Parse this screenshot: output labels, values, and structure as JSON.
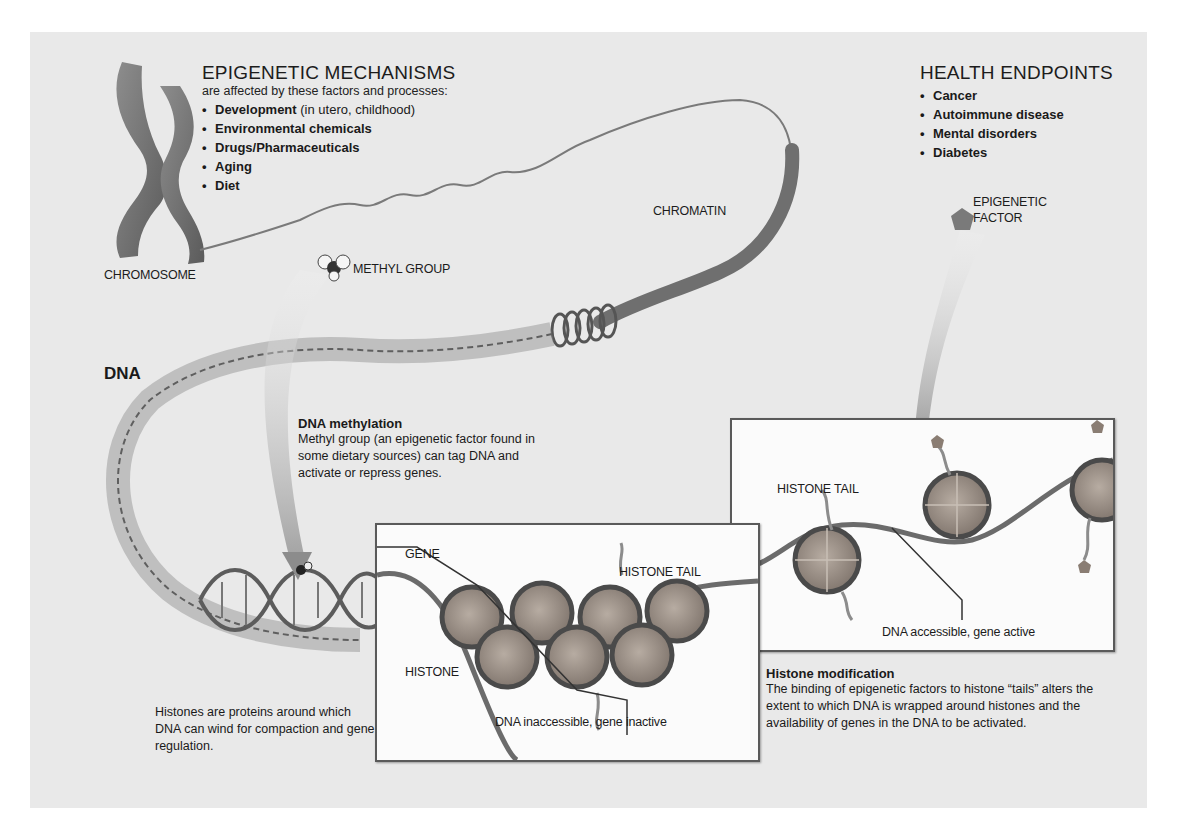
{
  "mechanisms": {
    "title": "EPIGENETIC MECHANISMS",
    "subtitle": "are affected by these factors and processes:",
    "items": [
      {
        "bold": "Development",
        "rest": " (in utero, childhood)"
      },
      {
        "bold": "Environmental chemicals",
        "rest": ""
      },
      {
        "bold": "Drugs/Pharmaceuticals",
        "rest": ""
      },
      {
        "bold": "Aging",
        "rest": ""
      },
      {
        "bold": "Diet",
        "rest": ""
      }
    ]
  },
  "health": {
    "title": "HEALTH ENDPOINTS",
    "items": [
      "Cancer",
      "Autoimmune disease",
      "Mental disorders",
      "Diabetes"
    ]
  },
  "labels": {
    "chromosome": "CHROMOSOME",
    "chromatin": "CHROMATIN",
    "methyl_group": "METHYL GROUP",
    "epigenetic_factor_line1": "EPIGENETIC",
    "epigenetic_factor_line2": "FACTOR",
    "dna": "DNA",
    "gene": "GENE",
    "histone_tail_left": "HISTONE TAIL",
    "histone": "HISTONE",
    "histone_tail_right": "HISTONE TAIL",
    "dna_inaccessible": "DNA inaccessible, gene inactive",
    "dna_accessible": "DNA accessible, gene active"
  },
  "methylation": {
    "heading": "DNA methylation",
    "body": "Methyl group (an epigenetic factor found in some dietary sources) can tag DNA and activate or repress genes."
  },
  "histones_note": {
    "body": "Histones are proteins around which DNA can wind for compaction and gene regulation."
  },
  "histone_modification": {
    "heading": "Histone modification",
    "body": "The binding of epigenetic factors to histone “tails” alters the extent to which DNA is wrapped around histones and the availability of genes in the DNA to be activated."
  },
  "colors": {
    "background": "#e9e9e9",
    "strand": "#6e6e6e",
    "histone_fill": "#9a8f86",
    "inset_border": "#5a5a5a"
  }
}
